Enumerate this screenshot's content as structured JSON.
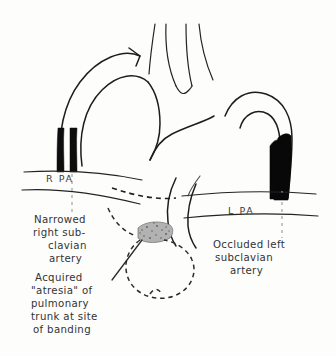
{
  "figure": {
    "background_color": "#fdfdfc",
    "ink_color": "#1d1d1d",
    "occluded_color": "#080808",
    "band_color": "#9a9a9a",
    "leader_color": "#8d8d8d"
  },
  "vessel_labels": [
    {
      "id": "rpa",
      "text": "R PA",
      "x": 46,
      "y": 182
    },
    {
      "id": "lpa",
      "text": "L PA",
      "x": 228,
      "y": 214
    }
  ],
  "callouts": [
    {
      "id": "narrowed-right-subclavian",
      "lines": [
        "Narrowed",
        "right sub-",
        "clavian",
        "artery"
      ],
      "align": [
        "left",
        "left",
        "center",
        "center"
      ],
      "x": 34,
      "y": 223
    },
    {
      "id": "occluded-left-subclavian",
      "lines": [
        "Occluded left",
        "subclavian",
        "artery"
      ],
      "align": [
        "left",
        "left",
        "center"
      ],
      "x": 213,
      "y": 245
    },
    {
      "id": "acquired-atresia-pulmonary-trunk",
      "lines": [
        "Acquired",
        "\"atresia\" of",
        "pulmonary",
        "trunk at site",
        "of banding"
      ],
      "align": [
        "left",
        "left",
        "left",
        "left",
        "left"
      ],
      "x": 33,
      "y": 278
    }
  ],
  "structures": [
    {
      "id": "aortic-arch",
      "name": "Aortic arch"
    },
    {
      "id": "right-subclavian-artery",
      "name": "Narrowed right subclavian artery",
      "state": "narrowed"
    },
    {
      "id": "left-subclavian-artery",
      "name": "Occluded left subclavian artery",
      "state": "occluded"
    },
    {
      "id": "right-pulmonary-artery",
      "name": "R PA"
    },
    {
      "id": "left-pulmonary-artery",
      "name": "L PA"
    },
    {
      "id": "pulmonary-trunk",
      "name": "Pulmonary trunk",
      "state": "acquired atresia"
    },
    {
      "id": "banding-site",
      "name": "Site of banding"
    },
    {
      "id": "carotid-arteries",
      "name": "Carotid arteries"
    }
  ]
}
